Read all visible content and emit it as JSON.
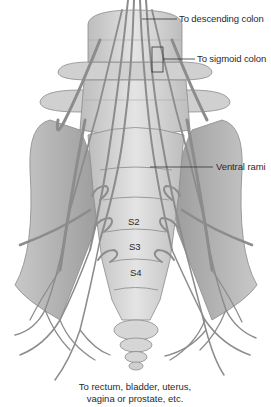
{
  "figure": {
    "colors": {
      "bone_fill": "#d9d9d9",
      "bone_shade": "#b8b8b8",
      "bone_outline": "#8a8a8a",
      "nerve": "#8c8c8c",
      "nerve_outline": "#6e6e6e",
      "leader_line": "#333333",
      "text": "#2a2a2a"
    }
  },
  "labels": {
    "descending_colon": "To descending colon",
    "sigmoid_colon": "To sigmoid colon",
    "ventral_rami": "Ventral rami",
    "s2": "S2",
    "s3": "S3",
    "s4": "S4"
  },
  "caption": {
    "line1": "To rectum, bladder, uterus,",
    "line2": "vagina or prostate, etc."
  }
}
